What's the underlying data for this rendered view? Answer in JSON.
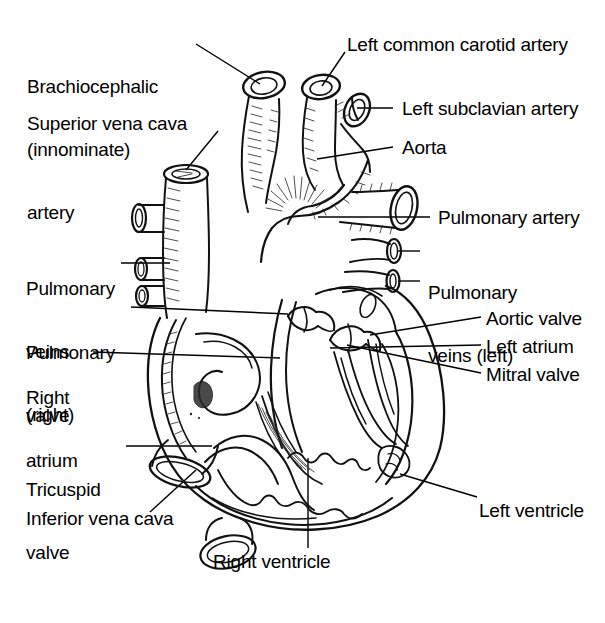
{
  "diagram": {
    "style": "black-and-white line drawing",
    "width": 605,
    "height": 623,
    "background_color": "#ffffff",
    "line_color": "#111111",
    "text_color": "#000000"
  },
  "labels": {
    "brachiocephalic": {
      "line1": "Brachiocephalic",
      "line2": "(innominate)",
      "line3": "artery"
    },
    "superior_vena_cava": "Superior vena cava",
    "left_common_carotid": "Left common carotid artery",
    "left_subclavian": "Left subclavian artery",
    "aorta": "Aorta",
    "pulmonary_artery": "Pulmonary artery",
    "pulmonary_veins_right": {
      "line1": "Pulmonary",
      "line2": "veins",
      "line3": "(right)"
    },
    "pulmonary_veins_left": {
      "line1": "Pulmonary",
      "line2": "veins (left)"
    },
    "pulmonary_valve": {
      "line1": "Pulmonary",
      "line2": "valve"
    },
    "right_atrium": {
      "line1": "Right",
      "line2": "atrium"
    },
    "aortic_valve": "Aortic valve",
    "left_atrium": "Left atrium",
    "mitral_valve": "Mitral valve",
    "tricuspid_valve": {
      "line1": "Tricuspid",
      "line2": "valve"
    },
    "inferior_vena_cava": "Inferior vena cava",
    "left_ventricle": "Left ventricle",
    "right_ventricle": "Right ventricle"
  }
}
